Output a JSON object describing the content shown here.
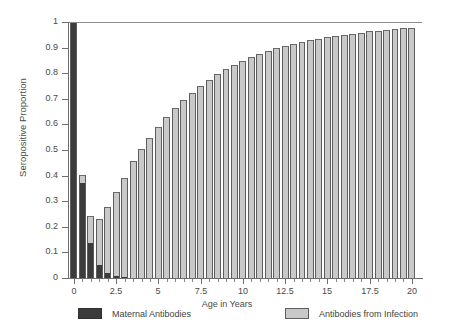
{
  "chart_data": {
    "type": "bar",
    "stacked": true,
    "title": "",
    "xlabel": "Age in Years",
    "ylabel": "Seropositive Proportion",
    "xlim": [
      -0.35,
      20.6
    ],
    "ylim": [
      0,
      1
    ],
    "grid": false,
    "legend_position": "bottom",
    "x_tick_labels": [
      "0",
      "2.5",
      "5",
      "7.5",
      "10",
      "12.5",
      "15",
      "17.5",
      "20"
    ],
    "x_tick_values": [
      0,
      2.5,
      5,
      7.5,
      10,
      12.5,
      15,
      17.5,
      20
    ],
    "x_minor_tick_step": 0.5,
    "y_tick_labels": [
      "0",
      "0.1",
      "0.2",
      "0.3",
      "0.4",
      "0.5",
      "0.6",
      "0.7",
      "0.8",
      "0.9",
      "1"
    ],
    "y_tick_values": [
      0,
      0.1,
      0.2,
      0.3,
      0.4,
      0.5,
      0.6,
      0.7,
      0.8,
      0.9,
      1
    ],
    "colors": {
      "maternal": "#3b3b3b",
      "infection": "#c9c9c9",
      "axis": "#6e6e6e"
    },
    "x": [
      0,
      0.5,
      1,
      1.5,
      2,
      2.5,
      3,
      3.5,
      4,
      4.5,
      5,
      5.5,
      6,
      6.5,
      7,
      7.5,
      8,
      8.5,
      9,
      9.5,
      10,
      10.5,
      11,
      11.5,
      12,
      12.5,
      13,
      13.5,
      14,
      14.5,
      15,
      15.5,
      16,
      16.5,
      17,
      17.5,
      18,
      18.5,
      19,
      19.5,
      20
    ],
    "series": [
      {
        "name": "Maternal Antibodies",
        "color": "#3b3b3b",
        "values": [
          1.0,
          0.37,
          0.135,
          0.052,
          0.018,
          0.007,
          0.003,
          0.001,
          0,
          0,
          0,
          0,
          0,
          0,
          0,
          0,
          0,
          0,
          0,
          0,
          0,
          0,
          0,
          0,
          0,
          0,
          0,
          0,
          0,
          0,
          0,
          0,
          0,
          0,
          0,
          0,
          0,
          0,
          0,
          0,
          0
        ]
      },
      {
        "name": "Antibodies from Infection",
        "color": "#c9c9c9",
        "values": [
          0,
          0.032,
          0.107,
          0.18,
          0.26,
          0.33,
          0.388,
          0.455,
          0.503,
          0.548,
          0.59,
          0.629,
          0.664,
          0.696,
          0.724,
          0.752,
          0.775,
          0.797,
          0.816,
          0.833,
          0.849,
          0.863,
          0.876,
          0.887,
          0.897,
          0.906,
          0.914,
          0.922,
          0.929,
          0.935,
          0.941,
          0.946,
          0.951,
          0.955,
          0.959,
          0.963,
          0.966,
          0.969,
          0.972,
          0.975,
          0.978
        ]
      }
    ],
    "totals": [
      1.0,
      0.402,
      0.242,
      0.232,
      0.278,
      0.337,
      0.391,
      0.456,
      0.503,
      0.548,
      0.59,
      0.629,
      0.664,
      0.696,
      0.724,
      0.752,
      0.775,
      0.797,
      0.816,
      0.833,
      0.849,
      0.863,
      0.876,
      0.887,
      0.897,
      0.906,
      0.914,
      0.922,
      0.929,
      0.935,
      0.941,
      0.946,
      0.951,
      0.955,
      0.959,
      0.963,
      0.966,
      0.969,
      0.972,
      0.975,
      0.978
    ]
  },
  "legend": {
    "maternal_label": "Maternal Antibodies",
    "infection_label": "Antibodies from Infection"
  }
}
